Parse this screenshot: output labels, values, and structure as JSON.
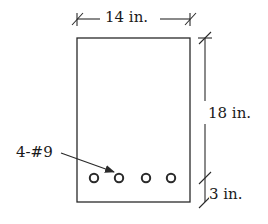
{
  "diagram": {
    "type": "beam-cross-section",
    "colors": {
      "line": "#2a2a2a",
      "background": "#ffffff",
      "text": "#1a1a1a"
    },
    "section": {
      "width_label": "14 in.",
      "height_label": "18 in.",
      "cover_label": "3 in.",
      "reinforcement_label": "4-#9",
      "bar_count": 4
    }
  }
}
